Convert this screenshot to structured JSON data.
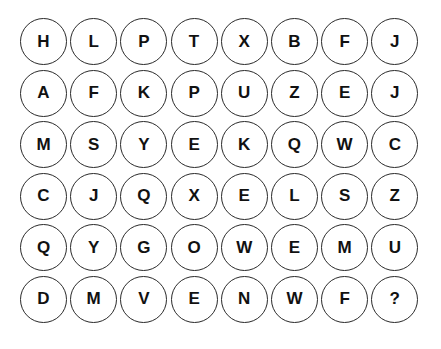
{
  "puzzle": {
    "rows": [
      [
        "H",
        "L",
        "P",
        "T",
        "X",
        "B",
        "F",
        "J"
      ],
      [
        "A",
        "F",
        "K",
        "P",
        "U",
        "Z",
        "E",
        "J"
      ],
      [
        "M",
        "S",
        "Y",
        "E",
        "K",
        "Q",
        "W",
        "C"
      ],
      [
        "C",
        "J",
        "Q",
        "X",
        "E",
        "L",
        "S",
        "Z"
      ],
      [
        "Q",
        "Y",
        "G",
        "O",
        "W",
        "E",
        "M",
        "U"
      ],
      [
        "D",
        "M",
        "V",
        "E",
        "N",
        "W",
        "F",
        "?"
      ]
    ]
  }
}
